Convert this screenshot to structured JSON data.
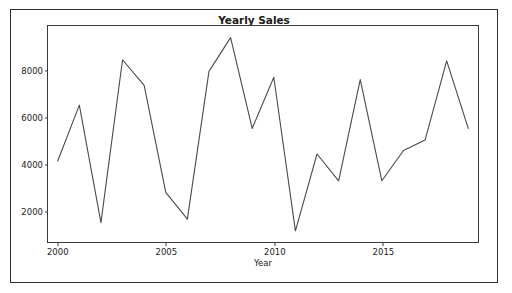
{
  "window": {
    "ghost_top_text": ""
  },
  "chart_data": {
    "type": "line",
    "title": "Yearly Sales",
    "xlabel": "Year",
    "ylabel": "",
    "x": [
      2000,
      2001,
      2002,
      2003,
      2004,
      2005,
      2006,
      2007,
      2008,
      2009,
      2010,
      2011,
      2012,
      2013,
      2014,
      2015,
      2016,
      2017,
      2018,
      2019
    ],
    "values": [
      4100,
      6500,
      1450,
      8450,
      7350,
      2750,
      1600,
      7950,
      9400,
      5500,
      7700,
      1100,
      4400,
      3250,
      7600,
      3250,
      4550,
      5000,
      8400,
      5500
    ],
    "series": [
      {
        "name": "Yearly Sales",
        "values": [
          4100,
          6500,
          1450,
          8450,
          7350,
          2750,
          1600,
          7950,
          9400,
          5500,
          7700,
          1100,
          4400,
          3250,
          7600,
          3250,
          4550,
          5000,
          8400,
          5500
        ]
      }
    ],
    "xlim": [
      1999.55,
      2019.45
    ],
    "ylim": [
      620,
      9900
    ],
    "xticks": [
      2000,
      2005,
      2010,
      2015
    ],
    "xtick_labels": [
      "2000",
      "2005",
      "2010",
      "2015"
    ],
    "yticks": [
      2000,
      4000,
      6000,
      8000
    ],
    "ytick_labels": [
      "2000",
      "4000",
      "6000",
      "8000"
    ],
    "grid": false,
    "legend": false,
    "line_color": "#4a4a4a",
    "line_width": 1.1,
    "marker": "none"
  }
}
